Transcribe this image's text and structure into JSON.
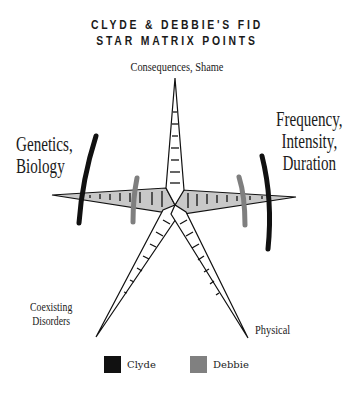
{
  "title": {
    "line1": "CLYDE & DEBBIE'S FID",
    "line2": "STAR MATRIX POINTS"
  },
  "axes": {
    "top": "Consequences, Shame",
    "left": [
      "Genetics,",
      "Biology"
    ],
    "right": [
      "Frequency,",
      "Intensity,",
      "Duration"
    ],
    "bottom_left": [
      "Coexisting",
      "Disorders"
    ],
    "bottom_right": "Physical"
  },
  "legend": [
    {
      "name": "Clyde",
      "color": "#111111"
    },
    {
      "name": "Debbie",
      "color": "#808080"
    }
  ],
  "colors": {
    "horizontal_arm_fill": "#c8c8c8",
    "arm_fill": "#ffffff",
    "outline": "#111111"
  }
}
